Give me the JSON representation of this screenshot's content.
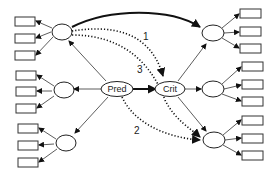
{
  "diagram": {
    "type": "structural-equation-model",
    "nodes": {
      "predictor": {
        "label": "Pred"
      },
      "criterion": {
        "label": "Crit"
      }
    },
    "paths": [
      {
        "label": "1",
        "style": "dotted",
        "from": "left-factor-top",
        "to": "Crit"
      },
      {
        "label": "2",
        "style": "dotted",
        "from": "Pred",
        "to": "right-factor-bottom"
      },
      {
        "label": "3",
        "style": "dotted",
        "from": "left-factor-top",
        "to": "right-factor-bottom"
      }
    ],
    "left_factors": 3,
    "right_factors": 3,
    "indicators_per_factor": 3
  }
}
